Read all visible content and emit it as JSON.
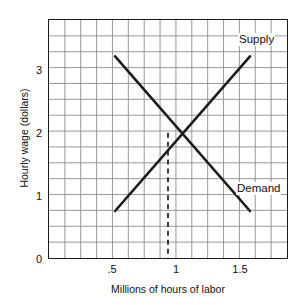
{
  "chart_data": {
    "type": "line",
    "title": "",
    "xlabel": "Millions of hours of labor",
    "ylabel": "Hourly wage (dollars)",
    "xlim": [
      0.1,
      1.9
    ],
    "ylim": [
      0,
      3.8
    ],
    "xticks": [
      0.5,
      1.0,
      1.5
    ],
    "xtick_labels": [
      ".5",
      "1",
      "1.5"
    ],
    "yticks": [
      0,
      1,
      2,
      3
    ],
    "ytick_labels": [
      "0",
      "1",
      "2",
      "3"
    ],
    "grid": true,
    "grid_color": "#8c8c8c",
    "grid_x_step": 0.12,
    "grid_y_step": 0.2533,
    "legend_position": "inline-annotation",
    "line_color": "#1a1a1a",
    "series": [
      {
        "name": "Supply",
        "label": "Supply",
        "slope": "upward",
        "points": [
          {
            "x": 0.6,
            "y": 0.75
          },
          {
            "x": 1.0,
            "y": 2.0
          },
          {
            "x": 1.62,
            "y": 3.22
          }
        ]
      },
      {
        "name": "Demand",
        "label": "Demand",
        "slope": "downward",
        "points": [
          {
            "x": 0.6,
            "y": 3.22
          },
          {
            "x": 1.0,
            "y": 2.0
          },
          {
            "x": 1.62,
            "y": 0.75
          }
        ]
      }
    ],
    "equilibrium": {
      "x": 1.0,
      "y": 2.0,
      "guide_line": "dashed-vertical",
      "guide_from_y": 2.0,
      "guide_to_y": 0
    }
  }
}
